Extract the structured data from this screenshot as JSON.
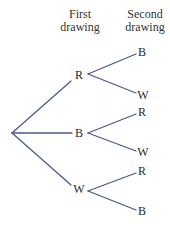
{
  "headers": {
    "first": {
      "line1": "First",
      "line2": "drawing"
    },
    "second": {
      "line1": "Second",
      "line2": "drawing"
    }
  },
  "colors": {
    "edge": "#4a5a8c",
    "text": "#2a2a2a"
  },
  "tree": {
    "root": {
      "x": 12,
      "y": 133
    },
    "first_level": [
      {
        "label": "R",
        "x": 79,
        "y": 75
      },
      {
        "label": "B",
        "x": 79,
        "y": 133
      },
      {
        "label": "W",
        "x": 79,
        "y": 189
      }
    ],
    "second_level": [
      {
        "parent": 0,
        "label": "B",
        "x": 142,
        "y": 52
      },
      {
        "parent": 0,
        "label": "W",
        "x": 143,
        "y": 95
      },
      {
        "parent": 1,
        "label": "R",
        "x": 142,
        "y": 112
      },
      {
        "parent": 1,
        "label": "W",
        "x": 143,
        "y": 152
      },
      {
        "parent": 2,
        "label": "R",
        "x": 142,
        "y": 171
      },
      {
        "parent": 2,
        "label": "B",
        "x": 142,
        "y": 211
      }
    ]
  }
}
